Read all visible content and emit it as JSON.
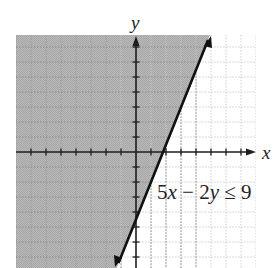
{
  "chart_data": {
    "type": "area",
    "title": "",
    "subtitle": "Graph of linear inequality",
    "xlabel": "x",
    "ylabel": "y",
    "xlim": [
      -8,
      8
    ],
    "ylim": [
      -7.7,
      7.8
    ],
    "grid": true,
    "grid_step": 1,
    "tick_labels_shown": false,
    "inequality": {
      "label_parts": [
        "5",
        "x",
        " − 2",
        "y",
        " ≤ 9"
      ],
      "label": "5x − 2y ≤ 9",
      "boundary": {
        "equation": "y = 2.5x - 4.5",
        "slope": 2.5,
        "y_intercept": -4.5,
        "x_intercept": 1.8,
        "style": "solid"
      },
      "shaded_side": "left/above boundary line",
      "boundary_points": [
        [
          -1.28,
          -7.7
        ],
        [
          4.92,
          7.8
        ]
      ]
    },
    "legend": "none"
  },
  "colors": {
    "shade": "#b4b4b4",
    "grid_shaded": "#8a8a8a",
    "grid_unshaded": "#c8c8c8",
    "axis": "#1e1e1e",
    "line": "#111111"
  }
}
